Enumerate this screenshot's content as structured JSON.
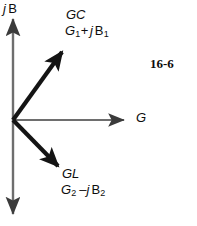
{
  "figure": {
    "number": "16-6",
    "background_color": "#ffffff",
    "axis_color": "#6e6e6e",
    "vector_color": "#141414",
    "text_color": "#0d0d0d"
  },
  "axes": {
    "vertical": {
      "label_j": "j",
      "label_b": "B",
      "label_full": "j B",
      "name": "imaginary-susceptance-axis"
    },
    "horizontal": {
      "label": "G",
      "name": "real-conductance-axis"
    },
    "origin": {
      "x": 13,
      "y": 120
    }
  },
  "vectors": [
    {
      "id": "gc",
      "name": "GC",
      "expression_main": "G",
      "expression_sub1": "1",
      "expression_op": "+",
      "expression_j": "j",
      "expression_b": "B",
      "expression_sub2": "1",
      "expression_full": "G1+ j B1",
      "from": {
        "x": 13,
        "y": 120
      },
      "to": {
        "x": 66,
        "y": 47
      }
    },
    {
      "id": "gl",
      "name": "GL",
      "expression_main": "G",
      "expression_sub1": "2",
      "expression_op": "–",
      "expression_j": "j",
      "expression_b": "B",
      "expression_sub2": "2",
      "expression_full": "G2 –j B2",
      "from": {
        "x": 13,
        "y": 120
      },
      "to": {
        "x": 62,
        "y": 171
      }
    }
  ]
}
